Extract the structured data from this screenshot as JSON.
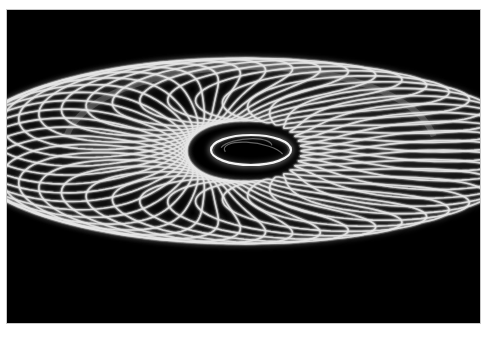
{
  "image": {
    "caption": "Spirograph light-painting torus on black background",
    "subject": "looping white light trails forming a tilted torus / donut shape",
    "background_color": "#000000",
    "frame_color": "#ffffff",
    "stroke_color": "#e6e6e6",
    "glow_color": "#9a9a9a"
  },
  "pattern": {
    "loop_count": 44,
    "back_loop_count": 44
  }
}
